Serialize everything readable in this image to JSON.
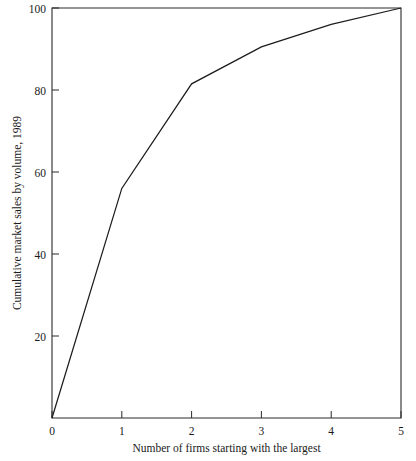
{
  "chart_data": {
    "type": "line",
    "title": "",
    "subtitle": "",
    "xlabel": "Number of firms starting with the largest",
    "ylabel": "Cumulative market sales by volume, 1989",
    "x": [
      0,
      1,
      2,
      3,
      4,
      5
    ],
    "values": [
      0,
      56,
      81.5,
      90.5,
      96,
      100
    ],
    "series": [
      {
        "name": "Cumulative market sales by volume, 1989",
        "x": [
          0,
          1,
          2,
          3,
          4,
          5
        ],
        "values": [
          0,
          56,
          81.5,
          90.5,
          96,
          100
        ]
      }
    ],
    "xlim": [
      0,
      5
    ],
    "ylim": [
      0,
      100
    ],
    "xticks": [
      0,
      1,
      2,
      3,
      4,
      5
    ],
    "xtick_labels": [
      "0",
      "1",
      "2",
      "3",
      "4",
      "5"
    ],
    "yticks": [
      20,
      40,
      60,
      80,
      100
    ],
    "ytick_labels": [
      "20",
      "40",
      "60",
      "80",
      "100"
    ],
    "grid": false,
    "legend": false,
    "legend_position": "none",
    "line_color": "#1d1d1d",
    "axis_color": "#2b2b2b",
    "background_color": "#ffffff",
    "frame": "box"
  }
}
